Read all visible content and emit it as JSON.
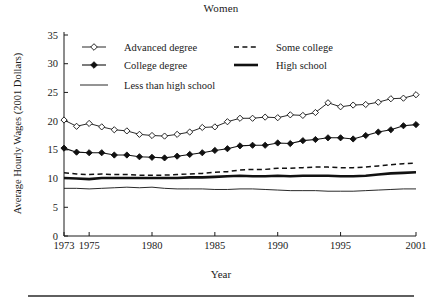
{
  "chart_data": {
    "type": "line",
    "title": "Women",
    "xlabel": "Year",
    "ylabel": "Average Hourly Wages (2001 Dollars)",
    "grid": false,
    "legend_position": "top-left-inside",
    "xlim": [
      1973,
      2001
    ],
    "ylim": [
      0,
      35
    ],
    "ytick_values": [
      0,
      5,
      10,
      15,
      20,
      25,
      30,
      35
    ],
    "ytick_labels": [
      "0",
      "5",
      "10",
      "15",
      "20",
      "25",
      "30",
      "35"
    ],
    "xtick_values": [
      1973,
      1975,
      1980,
      1985,
      1990,
      1995,
      2001
    ],
    "xtick_labels": [
      "1973",
      "1975",
      "1980",
      "1985",
      "1990",
      "1995",
      "2001"
    ],
    "x": [
      1973,
      1974,
      1975,
      1976,
      1977,
      1978,
      1979,
      1980,
      1981,
      1982,
      1983,
      1984,
      1985,
      1986,
      1987,
      1988,
      1989,
      1990,
      1991,
      1992,
      1993,
      1994,
      1995,
      1996,
      1997,
      1998,
      1999,
      2000,
      2001
    ],
    "series": [
      {
        "name": "Advanced degree",
        "marker": "open-diamond",
        "line_style": "solid-thin",
        "values": [
          20.2,
          19.1,
          19.6,
          19.0,
          18.5,
          18.3,
          17.7,
          17.5,
          17.4,
          17.7,
          18.1,
          18.9,
          19.0,
          19.9,
          20.5,
          20.5,
          20.7,
          20.6,
          21.1,
          21.0,
          21.5,
          23.2,
          22.5,
          22.8,
          22.9,
          23.3,
          23.9,
          24.0,
          24.6
        ]
      },
      {
        "name": "College degree",
        "marker": "filled-diamond",
        "line_style": "solid",
        "values": [
          15.3,
          14.6,
          14.5,
          14.5,
          14.1,
          14.1,
          13.8,
          13.7,
          13.6,
          13.9,
          14.2,
          14.5,
          14.9,
          15.2,
          15.7,
          15.8,
          15.8,
          16.2,
          16.1,
          16.6,
          16.8,
          17.1,
          17.1,
          16.9,
          17.5,
          18.1,
          18.5,
          19.2,
          19.4
        ]
      },
      {
        "name": "Some college",
        "marker": "none",
        "line_style": "dashed",
        "values": [
          11.0,
          10.8,
          10.7,
          10.8,
          10.7,
          10.7,
          10.6,
          10.6,
          10.6,
          10.7,
          10.8,
          10.9,
          11.1,
          11.2,
          11.5,
          11.6,
          11.6,
          11.8,
          11.8,
          11.9,
          12.0,
          12.0,
          11.9,
          11.9,
          12.0,
          12.2,
          12.4,
          12.6,
          12.7
        ]
      },
      {
        "name": "High school",
        "marker": "none",
        "line_style": "solid-thick",
        "values": [
          10.1,
          10.0,
          9.9,
          10.1,
          10.1,
          10.1,
          10.1,
          10.1,
          10.1,
          10.1,
          10.2,
          10.2,
          10.3,
          10.4,
          10.5,
          10.4,
          10.4,
          10.5,
          10.4,
          10.5,
          10.5,
          10.5,
          10.4,
          10.4,
          10.5,
          10.7,
          10.9,
          11.0,
          11.1
        ]
      },
      {
        "name": "Less than high school",
        "marker": "none",
        "line_style": "solid-thin",
        "values": [
          8.3,
          8.3,
          8.2,
          8.3,
          8.4,
          8.5,
          8.4,
          8.5,
          8.3,
          8.2,
          8.2,
          8.2,
          8.1,
          8.1,
          8.2,
          8.2,
          8.1,
          8.0,
          7.9,
          7.9,
          7.9,
          7.8,
          7.8,
          7.8,
          7.9,
          8.0,
          8.1,
          8.2,
          8.2
        ]
      }
    ],
    "legend": [
      {
        "label": "Advanced degree",
        "sample": "line-open-diamond"
      },
      {
        "label": "Some college",
        "sample": "dashed-line"
      },
      {
        "label": "College degree",
        "sample": "line-filled-diamond"
      },
      {
        "label": "High school",
        "sample": "thick-line"
      },
      {
        "label": "Less than high school",
        "sample": "thin-line"
      }
    ]
  }
}
